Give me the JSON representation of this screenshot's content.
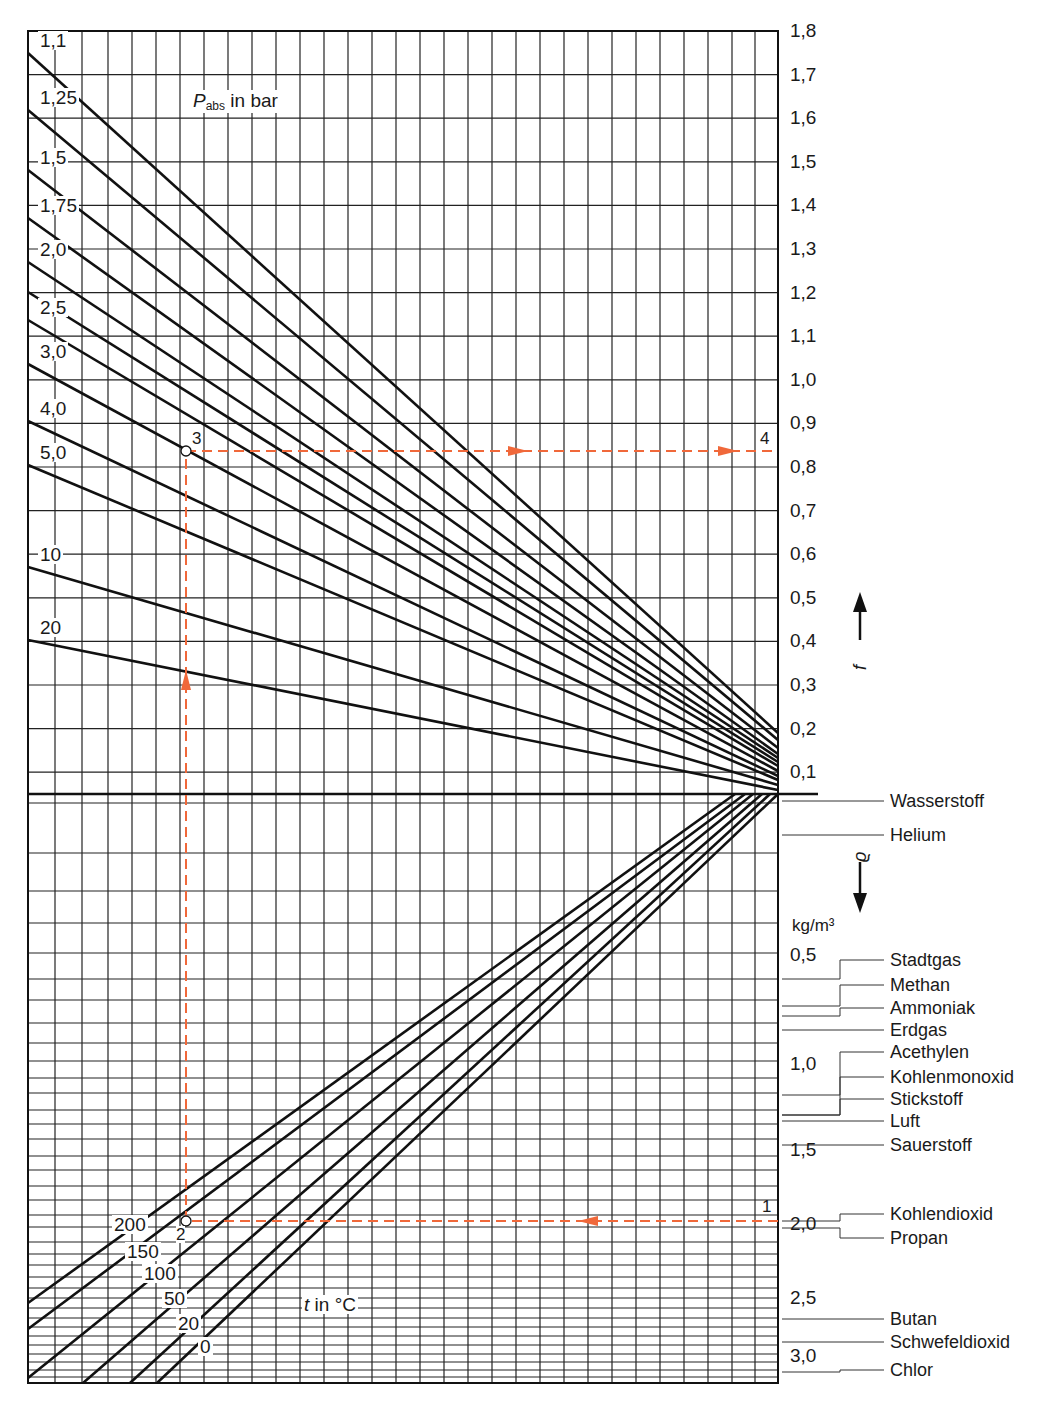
{
  "chart_data": {
    "type": "nomogram",
    "title": "Pabs in bar",
    "upper_panel": {
      "ylabel": "f_L",
      "yaxis_ticks": [
        "1,8",
        "1,7",
        "1,6",
        "1,5",
        "1,4",
        "1,3",
        "1,2",
        "1,1",
        "1,0",
        "0,9",
        "0,8",
        "0,7",
        "0,6",
        "0,5",
        "0,4",
        "0,3",
        "0,2",
        "0,1"
      ],
      "ylim": [
        0.0,
        1.8
      ],
      "series_label": "Pabs in bar",
      "pressure_lines": [
        {
          "label": "1,1",
          "left_y": 53,
          "right_y": 733
        },
        {
          "label": "1,25",
          "left_y": 110,
          "right_y": 740
        },
        {
          "label": "1,5",
          "left_y": 170,
          "right_y": 748
        },
        {
          "label": "1,75",
          "left_y": 218,
          "right_y": 754
        },
        {
          "label": "2,0",
          "left_y": 262,
          "right_y": 758
        },
        {
          "label": "",
          "left_y": 292,
          "right_y": 762
        },
        {
          "label": "2,5",
          "left_y": 320,
          "right_y": 766
        },
        {
          "label": "3,0",
          "left_y": 364,
          "right_y": 771
        },
        {
          "label": "4,0",
          "left_y": 421,
          "right_y": 776
        },
        {
          "label": "5,0",
          "left_y": 465,
          "right_y": 780
        },
        {
          "label": "10",
          "left_y": 567,
          "right_y": 785
        },
        {
          "label": "20",
          "left_y": 640,
          "right_y": 790
        }
      ]
    },
    "lower_panel": {
      "ylabel": "ϱ",
      "unit": "kg/m³",
      "yaxis_ticks": [
        "0,5",
        "1,0",
        "1,5",
        "2,0",
        "2,5",
        "3,0"
      ],
      "series_label": "t in °C",
      "temperature_lines": [
        {
          "label": "200",
          "x1": 28,
          "y1": 1303,
          "x2": 735,
          "y2": 794
        },
        {
          "label": "150",
          "x1": 28,
          "y1": 1329,
          "x2": 745,
          "y2": 794
        },
        {
          "label": "100",
          "x1": 28,
          "y1": 1378,
          "x2": 753,
          "y2": 794
        },
        {
          "label": "50",
          "x1": 83,
          "y1": 1383,
          "x2": 762,
          "y2": 794
        },
        {
          "label": "20",
          "x1": 130,
          "y1": 1383,
          "x2": 770,
          "y2": 794
        },
        {
          "label": "0",
          "x1": 157,
          "y1": 1383,
          "x2": 778,
          "y2": 794
        }
      ],
      "gases": [
        {
          "name": "Wasserstoff",
          "y": 801
        },
        {
          "name": "Helium",
          "y": 835
        },
        {
          "name": "Stadtgas",
          "y": 960
        },
        {
          "name": "Methan",
          "y": 985
        },
        {
          "name": "Ammoniak",
          "y": 1008
        },
        {
          "name": "Erdgas",
          "y": 1030
        },
        {
          "name": "Acethylen",
          "y": 1052
        },
        {
          "name": "Kohlenmonoxid",
          "y": 1077
        },
        {
          "name": "Stickstoff",
          "y": 1099
        },
        {
          "name": "Luft",
          "y": 1121
        },
        {
          "name": "Sauerstoff",
          "y": 1145
        },
        {
          "name": "Kohlendioxid",
          "y": 1214
        },
        {
          "name": "Propan",
          "y": 1238
        },
        {
          "name": "Butan",
          "y": 1319
        },
        {
          "name": "Schwefeldioxid",
          "y": 1342
        },
        {
          "name": "Chlor",
          "y": 1370
        }
      ]
    },
    "example_path": {
      "color": "#f0683a",
      "points": [
        {
          "label": "1",
          "x": 778,
          "y": 1221
        },
        {
          "label": "2",
          "x": 186,
          "y": 1221
        },
        {
          "label": "3",
          "x": 186,
          "y": 451
        },
        {
          "label": "4",
          "x": 778,
          "y": 451
        }
      ]
    }
  },
  "labels": {
    "title_p": "P",
    "title_sub": "abs",
    "title_rest": " in bar",
    "fl_label": "f",
    "fl_sub": "L",
    "rho_label": "ϱ",
    "unit": "kg/m³",
    "t_label_italic": "t",
    "t_label_rest": "  in °C",
    "pt1": "1",
    "pt2": "2",
    "pt3": "3",
    "pt4": "4"
  }
}
